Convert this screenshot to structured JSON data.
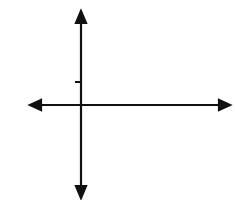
{
  "problem_number": "7.",
  "grid": {
    "columns": 8,
    "rows": 8,
    "x_range": [
      -2,
      6
    ],
    "y_range": [
      -4,
      4
    ],
    "line_color": "#555555"
  },
  "axes": {
    "x_label": "x",
    "y_label": "y",
    "origin_label": "O",
    "x_tick_label": "1",
    "y_tick_label": "1"
  },
  "triangles": [
    {
      "name": "PQR",
      "vertices": [
        {
          "label": "P",
          "x": 1,
          "y": 3
        },
        {
          "label": "Q",
          "x": 0,
          "y": 1
        },
        {
          "label": "R",
          "x": 4,
          "y": 1
        }
      ]
    },
    {
      "name": "P'Q'R'",
      "vertices": [
        {
          "label": "P′",
          "x": 1,
          "y": -3
        },
        {
          "label": "Q′",
          "x": 0,
          "y": -1
        },
        {
          "label": "R′",
          "x": 4,
          "y": -1
        }
      ]
    }
  ],
  "colors": {
    "stroke": "#111111"
  }
}
